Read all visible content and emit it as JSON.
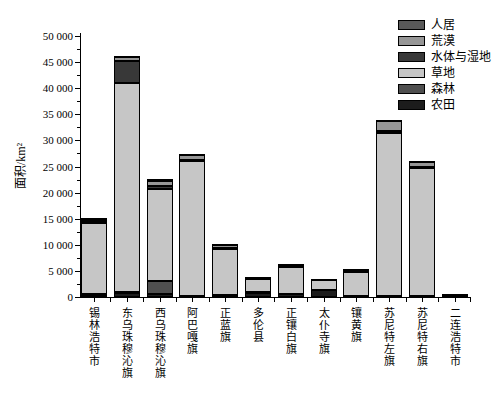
{
  "chart_data": {
    "type": "bar",
    "stacked": true,
    "stack_order": "bottom_to_top",
    "title": "",
    "xlabel": "",
    "ylabel": "面积/km²",
    "ylim": [
      0,
      50000
    ],
    "y_major_step": 5000,
    "y_minor_step": 2500,
    "y_tick_labels": [
      "0",
      "5 000",
      "10 000",
      "15 000",
      "20 000",
      "25 000",
      "30 000",
      "35 000",
      "40 000",
      "45 000",
      "50 000"
    ],
    "grid": false,
    "background": "#ffffff",
    "bar_border_color": "#000000",
    "categories": [
      "锡林浩特市",
      "东乌珠穆沁旗",
      "西乌珠穆沁旗",
      "阿巴嘎旗",
      "正蓝旗",
      "多伦县",
      "正镶白旗",
      "太仆寺旗",
      "镶黄旗",
      "苏尼特左旗",
      "苏尼特右旗",
      "二连浩特市"
    ],
    "series": [
      {
        "name": "农田",
        "color": "#1c1c1c",
        "values": [
          400,
          800,
          500,
          200,
          400,
          800,
          500,
          1400,
          200,
          200,
          100,
          0
        ]
      },
      {
        "name": "森林",
        "color": "#4f4f4f",
        "values": [
          100,
          200,
          2500,
          0,
          0,
          200,
          0,
          0,
          0,
          0,
          0,
          0
        ]
      },
      {
        "name": "草地",
        "color": "#c6c6c6",
        "values": [
          13600,
          40000,
          17700,
          25800,
          8700,
          2500,
          5300,
          1900,
          4600,
          31300,
          24700,
          300
        ]
      },
      {
        "name": "水体与湿地",
        "color": "#383838",
        "values": [
          200,
          4200,
          600,
          300,
          200,
          100,
          100,
          0,
          100,
          300,
          100,
          0
        ]
      },
      {
        "name": "荒漠",
        "color": "#969696",
        "values": [
          400,
          800,
          1000,
          900,
          700,
          100,
          200,
          0,
          200,
          2000,
          1000,
          50
        ]
      },
      {
        "name": "人居",
        "color": "#595959",
        "values": [
          500,
          200,
          300,
          200,
          200,
          100,
          100,
          200,
          100,
          200,
          200,
          50
        ]
      }
    ],
    "totals_estimated": [
      15200,
      46200,
      22600,
      27400,
      10200,
      3800,
      6200,
      3500,
      5200,
      34000,
      26100,
      400
    ],
    "legend": {
      "position": "upper-right",
      "items": [
        "人居",
        "荒漠",
        "水体与湿地",
        "草地",
        "森林",
        "农田"
      ]
    }
  }
}
